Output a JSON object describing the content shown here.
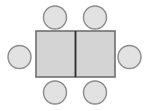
{
  "diagram": {
    "name": "table-seating-layout",
    "canvas": {
      "width": 145,
      "height": 111,
      "background": "#ffffff"
    },
    "colors": {
      "table_fill": "#d4d4d4",
      "table_stroke": "#6e6e6e",
      "table_divider": "#2b2b2b",
      "chair_fill": "#e2e2e2",
      "chair_stroke": "#8a8a8a",
      "background": "#ffffff"
    },
    "table": {
      "label": "table",
      "x": 36,
      "y": 31,
      "width": 79,
      "height": 46,
      "stroke_width": 1.6,
      "divider": {
        "label": "table-center-divider",
        "x": 75.5,
        "y1": 31,
        "y2": 77,
        "stroke_width": 1.8
      },
      "panels": [
        {
          "label": "table-panel-left",
          "x": 36,
          "y": 31,
          "width": 39.5,
          "height": 46
        },
        {
          "label": "table-panel-right",
          "x": 75.5,
          "y": 31,
          "width": 39.5,
          "height": 46
        }
      ]
    },
    "chairs": [
      {
        "label": "chair-top-left",
        "position": "top",
        "cx": 55,
        "cy": 17.5,
        "r": 11.5
      },
      {
        "label": "chair-top-right",
        "position": "top",
        "cx": 95,
        "cy": 17.5,
        "r": 11.5
      },
      {
        "label": "chair-left",
        "position": "left",
        "cx": 19.5,
        "cy": 57,
        "r": 11.5
      },
      {
        "label": "chair-right",
        "position": "right",
        "cx": 129.5,
        "cy": 57,
        "r": 11.5
      },
      {
        "label": "chair-bottom-left",
        "position": "bottom",
        "cx": 55,
        "cy": 92.5,
        "r": 11.5
      },
      {
        "label": "chair-bottom-right",
        "position": "bottom",
        "cx": 95,
        "cy": 92.5,
        "r": 11.5
      }
    ],
    "chair_stroke_width": 1.4,
    "seat_count": 6
  }
}
